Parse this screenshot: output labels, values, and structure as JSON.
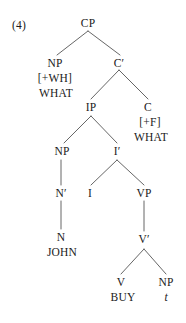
{
  "figure": {
    "example_number": "(4)",
    "width": 186,
    "height": 323,
    "line_color": "#555555",
    "text_color": "#1a1a1a"
  },
  "nodes": {
    "cp": "CP",
    "np_spec": "NP",
    "cbar": "C′",
    "ip": "IP",
    "c": "C",
    "np_subj": "NP",
    "ibar": "I′",
    "nbar": "N′",
    "i": "I",
    "vp": "VP",
    "n": "N",
    "vbar": "V′",
    "v": "V",
    "np_obj": "NP"
  },
  "features": {
    "wh": "[+WH]",
    "f": "[+F]"
  },
  "lexical": {
    "what_spec": "WHAT",
    "what_c": "WHAT",
    "john": "JOHN",
    "buy": "BUY",
    "trace": "t"
  }
}
